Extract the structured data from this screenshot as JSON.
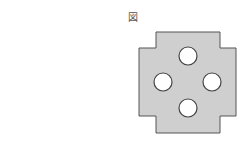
{
  "figure": {
    "label": "図",
    "shape": {
      "type": "cross-shaped plate",
      "outline_points": [
        [
          156,
          32
        ],
        [
          220,
          32
        ],
        [
          220,
          48
        ],
        [
          236,
          48
        ],
        [
          236,
          116
        ],
        [
          220,
          116
        ],
        [
          220,
          133
        ],
        [
          156,
          133
        ],
        [
          156,
          116
        ],
        [
          139,
          116
        ],
        [
          139,
          48
        ],
        [
          156,
          48
        ]
      ],
      "fill": "#cfcfcf",
      "stroke": "#555555"
    },
    "holes": [
      {
        "name": "top",
        "cx": 188,
        "cy": 56,
        "r": 9
      },
      {
        "name": "left",
        "cx": 163,
        "cy": 82,
        "r": 9
      },
      {
        "name": "right",
        "cx": 212,
        "cy": 82,
        "r": 9
      },
      {
        "name": "bottom",
        "cx": 188,
        "cy": 108,
        "r": 9
      }
    ],
    "hole_fill": "#ffffff",
    "hole_stroke": "#444444"
  }
}
